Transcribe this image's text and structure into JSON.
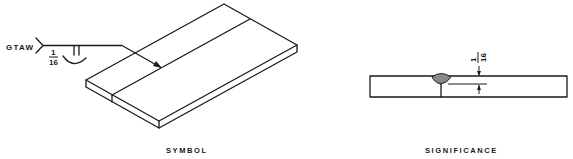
{
  "figure": {
    "panels": [
      {
        "id": "symbol",
        "caption": "SYMBOL",
        "weld_symbol": {
          "process": "GTAW",
          "weld_type": "square groove",
          "arrow_side_dimension": "1/16",
          "dimension_numerator": "1",
          "dimension_denominator": "16",
          "supplementary": "back/melt-through contour"
        },
        "illustration": "isometric butt-jointed plates with arrow to joint"
      },
      {
        "id": "significance",
        "caption": "SIGNIFICANCE",
        "dimension_numerator": "1",
        "dimension_denominator": "16",
        "illustration": "cross-section of square groove weld with root opening/penetration dimension"
      }
    ],
    "colors": {
      "ink": "#1a1a1a",
      "weld_fill": "#8a8a8a",
      "background": "#ffffff"
    }
  }
}
